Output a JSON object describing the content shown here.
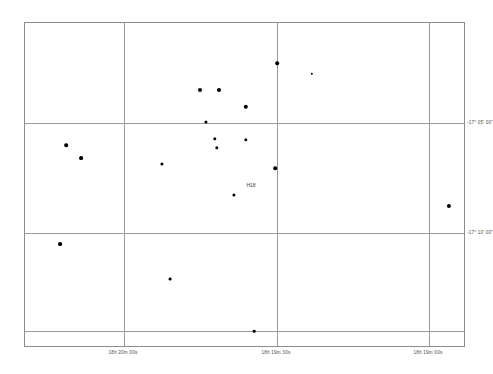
{
  "chart_data": {
    "type": "scatter",
    "title": "",
    "subtitle": "",
    "xlabel": "",
    "ylabel": "",
    "grid": true,
    "legend": null,
    "xaxis": {
      "name": "Right Ascension",
      "direction": "decreasing-left-to-right",
      "ticks": [
        {
          "label": "18h 20m 00s",
          "px": 123
        },
        {
          "label": "18h 19m 30s",
          "px": 276
        },
        {
          "label": "18h 19m 00s",
          "px": 428
        }
      ],
      "range_labels": [
        "18h 20m 00s",
        "18h 19m 00s"
      ]
    },
    "yaxis": {
      "name": "Declination",
      "ticks": [
        {
          "label": "-17° 05' 00\"",
          "px": 122
        },
        {
          "label": "-17° 10' 00\"",
          "px": 232
        }
      ],
      "range_labels": [
        "-17° 05' 00\"",
        "-17° 10' 00\""
      ]
    },
    "extra_gridlines": {
      "horizontal_unlabeled_px": [
        330
      ]
    },
    "annotations": [
      {
        "text": "H18",
        "x": 250,
        "y": 184
      }
    ],
    "marker_color": "#000000",
    "grid_color": "#9a9a9a",
    "frame_color": "#8d8d8d",
    "points": [
      {
        "id": "s1",
        "x": 276,
        "y": 62,
        "size": 3.6
      },
      {
        "id": "s2",
        "x": 311,
        "y": 73,
        "size": 2.4
      },
      {
        "id": "s3",
        "x": 199,
        "y": 89,
        "size": 4.0
      },
      {
        "id": "s4",
        "x": 218,
        "y": 89,
        "size": 4.0
      },
      {
        "id": "s5",
        "x": 245,
        "y": 106,
        "size": 4.4
      },
      {
        "id": "s6",
        "x": 205,
        "y": 121,
        "size": 3.2
      },
      {
        "id": "s7",
        "x": 65,
        "y": 144,
        "size": 3.6
      },
      {
        "id": "s8",
        "x": 214,
        "y": 138,
        "size": 3.4
      },
      {
        "id": "s9",
        "x": 245,
        "y": 139,
        "size": 3.4
      },
      {
        "id": "s10",
        "x": 80,
        "y": 157,
        "size": 3.8
      },
      {
        "id": "s11",
        "x": 216,
        "y": 147,
        "size": 3.4
      },
      {
        "id": "s12",
        "x": 161,
        "y": 163,
        "size": 3.2
      },
      {
        "id": "s13",
        "x": 274,
        "y": 167,
        "size": 3.6
      },
      {
        "id": "s14",
        "x": 448,
        "y": 205,
        "size": 4.2
      },
      {
        "id": "s15",
        "x": 233,
        "y": 194,
        "size": 3.2
      },
      {
        "id": "s16",
        "x": 59,
        "y": 243,
        "size": 3.8
      },
      {
        "id": "s17",
        "x": 169,
        "y": 278,
        "size": 2.8
      },
      {
        "id": "s18",
        "x": 253,
        "y": 330,
        "size": 2.6
      }
    ]
  },
  "figure": {
    "background_color": "#ffffff",
    "frame": {
      "left": 24,
      "top": 22,
      "width": 441,
      "height": 325
    }
  }
}
